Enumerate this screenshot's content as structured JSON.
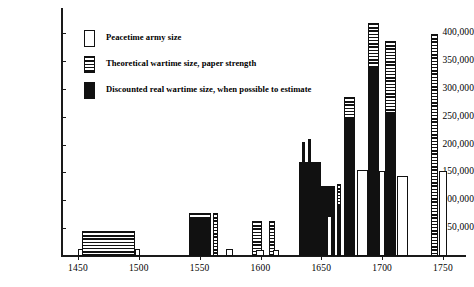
{
  "chart_data": {
    "type": "bar",
    "title": "",
    "subtitle": "",
    "xlabel": "",
    "ylabel": "",
    "grid": false,
    "legend_position": "upper-left",
    "ylim": [
      0,
      425000
    ],
    "xlim": [
      1440,
      1765
    ],
    "ytick_labels": [
      "400,000",
      "350,000",
      "300,000",
      "250,000",
      "200,000",
      "150,000",
      "100,000",
      "50,000"
    ],
    "ytick_values": [
      400000,
      350000,
      300000,
      250000,
      200000,
      150000,
      100000,
      50000
    ],
    "xtick_labels": [
      "1450",
      "1500",
      "1550",
      "1600",
      "1650",
      "1700",
      "1750"
    ],
    "xtick_values": [
      1450,
      1500,
      1550,
      1600,
      1650,
      1700,
      1750
    ],
    "series": [
      {
        "name": "Peacetime army size",
        "key": "peace",
        "fill": "white-outline"
      },
      {
        "name": "Theoretical wartime size, paper strength",
        "key": "paper",
        "fill": "horizontal-hatch"
      },
      {
        "name": "Discounted real wartime size, when possible to estimate",
        "key": "real",
        "fill": "solid-black"
      }
    ],
    "bars": [
      {
        "label": "1450 peacetime",
        "series": "peace",
        "x": 1450,
        "value": 12000,
        "width_years": 4
      },
      {
        "label": "1450-1500 paper strength",
        "series": "paper",
        "x": 1453,
        "value": 45000,
        "width_years": 44
      },
      {
        "label": "1500 peacetime",
        "series": "peace",
        "x": 1497,
        "value": 12000,
        "width_years": 4
      },
      {
        "label": "1550 real wartime",
        "series": "real",
        "x": 1541,
        "value": 70000,
        "width_years": 18
      },
      {
        "label": "1550 paper strength cap",
        "series": "paper",
        "x": 1541,
        "value": 78000,
        "width_years": 18
      },
      {
        "label": "1555 paper strength",
        "series": "paper",
        "x": 1561,
        "value": 78000,
        "width_years": 4
      },
      {
        "label": "1570 peacetime",
        "series": "peace",
        "x": 1572,
        "value": 12000,
        "width_years": 5
      },
      {
        "label": "1595 paper strength",
        "series": "paper",
        "x": 1593,
        "value": 62000,
        "width_years": 8
      },
      {
        "label": "1595 peacetime",
        "series": "peace",
        "x": 1596,
        "value": 11000,
        "width_years": 7
      },
      {
        "label": "1610 paper strength",
        "series": "paper",
        "x": 1607,
        "value": 62000,
        "width_years": 5
      },
      {
        "label": "1610 peacetime",
        "series": "peace",
        "x": 1610,
        "value": 11000,
        "width_years": 5
      },
      {
        "label": "1635 real wartime",
        "series": "real",
        "x": 1632,
        "value": 168000,
        "width_years": 18
      },
      {
        "label": "1635 paper spike A",
        "series": "real",
        "x": 1634,
        "value": 205000,
        "width_years": 2
      },
      {
        "label": "1635 paper spike B",
        "series": "real",
        "x": 1639,
        "value": 209000,
        "width_years": 2
      },
      {
        "label": "1650 real wartime",
        "series": "real",
        "x": 1650,
        "value": 126000,
        "width_years": 11
      },
      {
        "label": "1655 peacetime",
        "series": "peace",
        "x": 1655,
        "value": 71000,
        "width_years": 4
      },
      {
        "label": "1663 real wartime",
        "series": "real",
        "x": 1663,
        "value": 92000,
        "width_years": 3
      },
      {
        "label": "1663 paper strength",
        "series": "paper",
        "x": 1663,
        "value": 130000,
        "width_years": 3
      },
      {
        "label": "1672 real wartime",
        "series": "real",
        "x": 1669,
        "value": 248000,
        "width_years": 9
      },
      {
        "label": "1672 paper strength cap",
        "series": "paper",
        "x": 1669,
        "value": 285000,
        "width_years": 9
      },
      {
        "label": "1678 peacetime",
        "series": "peace",
        "x": 1679,
        "value": 155000,
        "width_years": 9
      },
      {
        "label": "1690 real wartime",
        "series": "real",
        "x": 1688,
        "value": 340000,
        "width_years": 9
      },
      {
        "label": "1690 paper strength cap",
        "series": "paper",
        "x": 1688,
        "value": 418000,
        "width_years": 9
      },
      {
        "label": "1697 peacetime",
        "series": "peace",
        "x": 1697,
        "value": 152000,
        "width_years": 5
      },
      {
        "label": "1705 real wartime",
        "series": "real",
        "x": 1702,
        "value": 258000,
        "width_years": 9
      },
      {
        "label": "1705 paper strength cap",
        "series": "paper",
        "x": 1702,
        "value": 385000,
        "width_years": 9
      },
      {
        "label": "1715 peacetime",
        "series": "peace",
        "x": 1712,
        "value": 143000,
        "width_years": 9
      },
      {
        "label": "1745 paper strength",
        "series": "paper",
        "x": 1740,
        "value": 398000,
        "width_years": 6
      },
      {
        "label": "1750 peacetime",
        "series": "peace",
        "x": 1747,
        "value": 152000,
        "width_years": 6
      }
    ]
  },
  "legend": {
    "items": [
      {
        "label": "Peacetime army size",
        "swatch": "white-outline"
      },
      {
        "label": "Theoretical wartime size, paper strength",
        "swatch": "horizontal-hatch"
      },
      {
        "label": "Discounted real wartime size, when possible to estimate",
        "swatch": "solid-black"
      }
    ]
  },
  "colors": {
    "ink": "#111111",
    "paper": "#ffffff"
  }
}
